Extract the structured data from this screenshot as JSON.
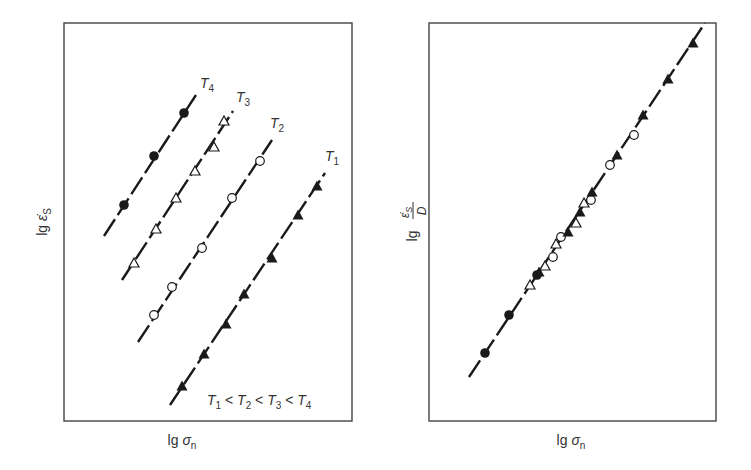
{
  "figure": {
    "colors": {
      "ink": "#1a1a1a",
      "frame": "#444444",
      "label": "#333333",
      "background": "#ffffff"
    }
  },
  "chart_data": [
    {
      "type": "scatter",
      "panel": "left",
      "title": "",
      "xlabel": "lg σn",
      "ylabel": "lg ε̇S",
      "xlabel_parts": {
        "prefix": "lg",
        "symbol": "σ",
        "subscript": "n"
      },
      "ylabel_parts": {
        "prefix": "lg",
        "symbol": "ε̇",
        "subscript": "S"
      },
      "grid": false,
      "ticks": false,
      "annotation": "T1 < T2 < T3 < T4",
      "annotation_parts": [
        "T",
        "1",
        " < ",
        "T",
        "2",
        " < ",
        "T",
        "3",
        " < ",
        "T",
        "4"
      ],
      "frame_px": {
        "x0": 64,
        "y0": 23,
        "x1": 352,
        "y1": 421
      },
      "series": [
        {
          "name": "T4",
          "label_main": "T",
          "label_sub": "4",
          "marker": "filled-circle",
          "label_px": [
            200,
            88
          ],
          "fit_line_px": [
            [
              104,
              236
            ],
            [
              196,
              95
            ]
          ],
          "points_px": [
            [
              124,
              205
            ],
            [
              154,
              156
            ],
            [
              184,
              113
            ]
          ]
        },
        {
          "name": "T3",
          "label_main": "T",
          "label_sub": "3",
          "marker": "open-triangle",
          "label_px": [
            236,
            102
          ],
          "fit_line_px": [
            [
              122,
              280
            ],
            [
              233,
              111
            ]
          ],
          "points_px": [
            [
              134,
              263
            ],
            [
              156,
              229
            ],
            [
              176,
              198
            ],
            [
              195,
              171
            ],
            [
              214,
              147
            ],
            [
              224,
              121
            ]
          ]
        },
        {
          "name": "T2",
          "label_main": "T",
          "label_sub": "2",
          "marker": "open-circle",
          "label_px": [
            270,
            128
          ],
          "fit_line_px": [
            [
              138,
              342
            ],
            [
              272,
              140
            ]
          ],
          "points_px": [
            [
              154,
              315
            ],
            [
              172,
              287
            ],
            [
              202,
              248
            ],
            [
              232,
              198
            ],
            [
              260,
              161
            ]
          ]
        },
        {
          "name": "T1",
          "label_main": "T",
          "label_sub": "1",
          "marker": "filled-triangle",
          "label_px": [
            325,
            161
          ],
          "fit_line_px": [
            [
              170,
              405
            ],
            [
              325,
              173
            ]
          ],
          "points_px": [
            [
              182,
              386
            ],
            [
              204,
              354
            ],
            [
              226,
              324
            ],
            [
              244,
              294
            ],
            [
              272,
              258
            ],
            [
              298,
              215
            ],
            [
              317,
              186
            ]
          ]
        }
      ]
    },
    {
      "type": "scatter",
      "panel": "right",
      "title": "",
      "xlabel": "lg σn",
      "ylabel": "lg (ε̇S / D)",
      "xlabel_parts": {
        "prefix": "lg",
        "symbol": "σ",
        "subscript": "n"
      },
      "ylabel_parts": {
        "prefix": "lg",
        "numerator": "ε̇",
        "numerator_sub": "S",
        "denominator": "D"
      },
      "grid": false,
      "ticks": false,
      "frame_px": {
        "x0": 429,
        "y0": 23,
        "x1": 716,
        "y1": 421
      },
      "master_line_px": [
        [
          469,
          377
        ],
        [
          705,
          23
        ]
      ],
      "series": [
        {
          "name": "T4",
          "marker": "filled-circle",
          "points_px": [
            [
              485,
              353
            ],
            [
              509,
              315
            ],
            [
              537,
              275
            ]
          ]
        },
        {
          "name": "T3",
          "marker": "open-triangle",
          "points_px": [
            [
              530,
              285
            ],
            [
              545,
              266
            ],
            [
              556,
              244
            ],
            [
              576,
              223
            ],
            [
              584,
              203
            ]
          ]
        },
        {
          "name": "T2",
          "marker": "open-circle",
          "points_px": [
            [
              553,
              257
            ],
            [
              561,
              237
            ],
            [
              591,
              200
            ],
            [
              610,
              165
            ],
            [
              634,
              135
            ]
          ]
        },
        {
          "name": "T1",
          "marker": "filled-triangle",
          "points_px": [
            [
              539,
              272
            ],
            [
              568,
              232
            ],
            [
              580,
              212
            ],
            [
              592,
              192
            ],
            [
              617,
              155
            ],
            [
              643,
              115
            ],
            [
              668,
              79
            ],
            [
              693,
              43
            ]
          ]
        }
      ]
    }
  ]
}
